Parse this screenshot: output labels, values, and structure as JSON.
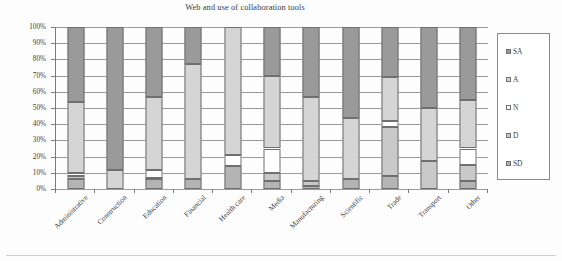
{
  "chart_data": {
    "type": "bar",
    "stacked": true,
    "stack_mode": "percent",
    "title": "Web and use of collaboration tools",
    "xlabel": "",
    "ylabel": "",
    "ylim": [
      0,
      100
    ],
    "ytick_labels": [
      "100%",
      "90%",
      "80%",
      "70%",
      "60%",
      "50%",
      "40%",
      "30%",
      "20%",
      "10%",
      "0%"
    ],
    "ytick_values": [
      100,
      90,
      80,
      70,
      60,
      50,
      40,
      30,
      20,
      10,
      0
    ],
    "grid": true,
    "legend_position": "right",
    "categories": [
      "Administrative",
      "Construction",
      "Education",
      "Financial",
      "Health care",
      "Media",
      "Manufacturing",
      "Scientific",
      "Trade",
      "Transport",
      "Other"
    ],
    "series": [
      {
        "name": "SD",
        "values": [
          6,
          0,
          6,
          6,
          14,
          5,
          2,
          6,
          8,
          0,
          5
        ]
      },
      {
        "name": "D",
        "values": [
          2,
          0,
          1,
          0,
          0,
          5,
          3,
          0,
          30,
          17,
          10
        ]
      },
      {
        "name": "N",
        "values": [
          2,
          0,
          5,
          0,
          7,
          15,
          0,
          0,
          4,
          0,
          10
        ]
      },
      {
        "name": "A",
        "values": [
          44,
          12,
          45,
          71,
          79,
          45,
          52,
          38,
          27,
          33,
          30
        ]
      },
      {
        "name": "SA",
        "values": [
          46,
          88,
          43,
          23,
          0,
          30,
          43,
          56,
          31,
          50,
          45
        ]
      }
    ],
    "series_colors": {
      "SD": "#b4b4b4",
      "D": "#c9c9c9",
      "N": "#ffffff",
      "A": "#d5d5d5",
      "SA": "#9a9a9a"
    }
  },
  "legend": {
    "items": [
      {
        "label": "SA",
        "color": "#9a9a9a"
      },
      {
        "label": "A",
        "color": "#d5d5d5"
      },
      {
        "label": "N",
        "color": "#ffffff"
      },
      {
        "label": "D",
        "color": "#c9c9c9"
      },
      {
        "label": "SD",
        "color": "#b4b4b4"
      }
    ]
  }
}
